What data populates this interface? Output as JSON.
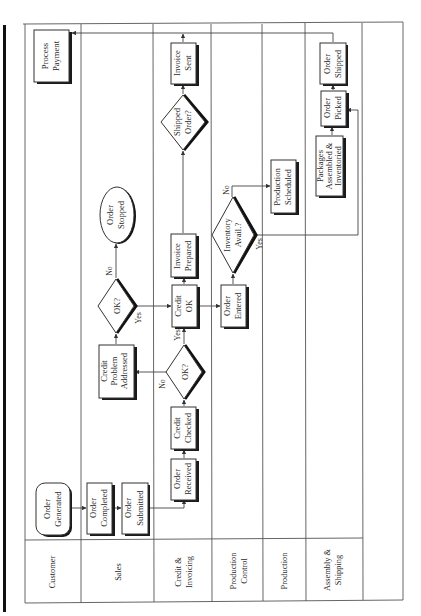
{
  "diagram": {
    "type": "swimlane-flowchart",
    "orientation": "rotated-90-ccw",
    "lanes": [
      {
        "label_line1": "Customer",
        "label_line2": ""
      },
      {
        "label_line1": "Sales",
        "label_line2": ""
      },
      {
        "label_line1": "Credit &",
        "label_line2": "Invoicing"
      },
      {
        "label_line1": "Production",
        "label_line2": "Control"
      },
      {
        "label_line1": "Production",
        "label_line2": ""
      },
      {
        "label_line1": "Assembly &",
        "label_line2": "Shipping"
      }
    ],
    "nodes": {
      "order_generated": {
        "line1": "Order",
        "line2": "Generated",
        "shape": "rounded-rect",
        "lane": "Customer"
      },
      "process_payment": {
        "line1": "Process",
        "line2": "Payment",
        "shape": "rect",
        "lane": "Customer"
      },
      "order_completed": {
        "line1": "Order",
        "line2": "Completed",
        "shape": "rect",
        "lane": "Sales"
      },
      "order_submitted": {
        "line1": "Order",
        "line2": "Submitted",
        "shape": "rect",
        "lane": "Sales"
      },
      "credit_problem_addressed": {
        "line1": "Credit",
        "line2": "Problem",
        "line3": "Addressed",
        "shape": "rect",
        "lane": "Sales"
      },
      "ok_sales": {
        "line1": "OK?",
        "shape": "diamond",
        "lane": "Sales"
      },
      "order_stopped": {
        "line1": "Order",
        "line2": "Stopped",
        "shape": "ellipse",
        "lane": "Sales"
      },
      "order_received": {
        "line1": "Order",
        "line2": "Received",
        "shape": "rect",
        "lane": "Credit & Invoicing"
      },
      "credit_checked": {
        "line1": "Credit",
        "line2": "Checked",
        "shape": "rect",
        "lane": "Credit & Invoicing"
      },
      "ok_credit": {
        "line1": "OK?",
        "shape": "diamond",
        "lane": "Credit & Invoicing"
      },
      "credit_ok": {
        "line1": "Credit",
        "line2": "OK",
        "shape": "rect",
        "lane": "Credit & Invoicing"
      },
      "invoice_prepared": {
        "line1": "Invoice",
        "line2": "Prepared",
        "shape": "rect",
        "lane": "Credit & Invoicing"
      },
      "shipped_order": {
        "line1": "Shipped",
        "line2": "Order?",
        "shape": "diamond",
        "lane": "Credit & Invoicing"
      },
      "invoice_sent": {
        "line1": "Invoice",
        "line2": "Sent",
        "shape": "rect",
        "lane": "Credit & Invoicing"
      },
      "order_entered": {
        "line1": "Order",
        "line2": "Entered",
        "shape": "rect",
        "lane": "Production Control"
      },
      "inventory_avail": {
        "line1": "Inventory",
        "line2": "Avail.?",
        "shape": "diamond",
        "lane": "Production Control"
      },
      "production_scheduled": {
        "line1": "Production",
        "line2": "Scheduled",
        "shape": "rect",
        "lane": "Production"
      },
      "packages_assembled": {
        "line1": "Packages",
        "line2": "Assembled &",
        "line3": "Inventoried",
        "shape": "rect",
        "lane": "Assembly & Shipping"
      },
      "order_picked": {
        "line1": "Order",
        "line2": "Picked",
        "shape": "rect",
        "lane": "Assembly & Shipping"
      },
      "order_shipped": {
        "line1": "Order",
        "line2": "Shipped",
        "shape": "rect",
        "lane": "Assembly & Shipping"
      }
    },
    "edge_labels": {
      "ok_credit_no": "No",
      "ok_credit_yes": "Yes",
      "ok_sales_no": "No",
      "ok_sales_yes": "Yes",
      "inventory_no": "No",
      "inventory_yes": "Yes"
    },
    "edges": [
      [
        "order_generated",
        "order_completed"
      ],
      [
        "order_completed",
        "order_submitted"
      ],
      [
        "order_submitted",
        "order_received"
      ],
      [
        "order_received",
        "credit_checked"
      ],
      [
        "credit_checked",
        "ok_credit"
      ],
      [
        "ok_credit",
        "credit_problem_addressed",
        "No"
      ],
      [
        "ok_credit",
        "credit_ok",
        "Yes"
      ],
      [
        "credit_problem_addressed",
        "ok_sales"
      ],
      [
        "ok_sales",
        "order_stopped",
        "No"
      ],
      [
        "ok_sales",
        "credit_ok",
        "Yes"
      ],
      [
        "credit_ok",
        "invoice_prepared"
      ],
      [
        "credit_ok",
        "order_entered"
      ],
      [
        "invoice_prepared",
        "shipped_order"
      ],
      [
        "shipped_order",
        "invoice_sent"
      ],
      [
        "order_entered",
        "inventory_avail"
      ],
      [
        "inventory_avail",
        "production_scheduled",
        "No"
      ],
      [
        "inventory_avail",
        "order_picked",
        "Yes"
      ],
      [
        "packages_assembled",
        "order_picked"
      ],
      [
        "order_picked",
        "order_shipped"
      ],
      [
        "order_shipped",
        "process_payment"
      ]
    ]
  }
}
